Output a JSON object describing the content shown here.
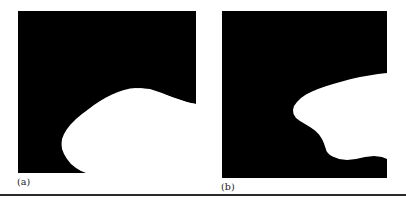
{
  "figure": {
    "background_color": "#ffffff",
    "panel_fill_color": "#000000",
    "region_fill_color": "#ffffff",
    "rule_color": "#2a2a2a",
    "panels": [
      {
        "id": "a",
        "caption": "(a)",
        "shape_description": "black field with white rounded blob occupying lower right, touching right and bottom edges"
      },
      {
        "id": "b",
        "caption": "(b)",
        "shape_description": "black field with white leftward-pointing wedge, jagged lower boundary, extending off right edge"
      }
    ]
  }
}
